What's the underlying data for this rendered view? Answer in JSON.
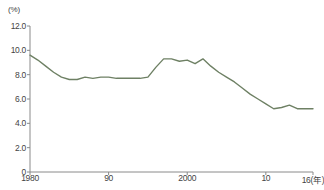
{
  "chart_data": {
    "type": "line",
    "title": "",
    "subtitle": "",
    "xlabel": "年",
    "ylabel": "(%)",
    "unit_label": "(%)",
    "year_axis_suffix": "16(年)",
    "grid": false,
    "legend": "none",
    "line_color": "#6e8064",
    "axis_color": "#8a8a8a",
    "ylim": [
      0,
      12
    ],
    "xlim": [
      1980,
      2016
    ],
    "ytick_labels": [
      "0",
      "2.0",
      "4.0",
      "6.0",
      "8.0",
      "10.0",
      "12.0"
    ],
    "ytick_values": [
      0,
      2,
      4,
      6,
      8,
      10,
      12
    ],
    "xtick_labels": [
      "1980",
      "90",
      "2000",
      "10",
      "16(年)"
    ],
    "xtick_values": [
      1980,
      1990,
      2000,
      2010,
      2016
    ],
    "series": [
      {
        "name": "率",
        "x": [
          1980,
          1981,
          1982,
          1983,
          1984,
          1985,
          1986,
          1987,
          1988,
          1989,
          1990,
          1991,
          1992,
          1993,
          1994,
          1995,
          1996,
          1997,
          1998,
          1999,
          2000,
          2001,
          2002,
          2003,
          2004,
          2005,
          2006,
          2007,
          2008,
          2009,
          2010,
          2011,
          2012,
          2013,
          2014,
          2015,
          2016
        ],
        "values": [
          9.6,
          9.2,
          8.7,
          8.2,
          7.8,
          7.6,
          7.6,
          7.8,
          7.7,
          7.8,
          7.8,
          7.7,
          7.7,
          7.7,
          7.7,
          7.8,
          8.6,
          9.3,
          9.3,
          9.1,
          9.2,
          8.9,
          9.3,
          8.7,
          8.2,
          7.8,
          7.4,
          6.9,
          6.4,
          6.0,
          5.6,
          5.2,
          5.3,
          5.5,
          5.2,
          5.2,
          5.2
        ]
      }
    ]
  },
  "source": {
    "note": ""
  }
}
